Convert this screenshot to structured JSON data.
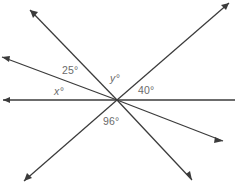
{
  "figure": {
    "type": "geometry-angle-diagram",
    "vertex": {
      "x": 117,
      "y": 100
    },
    "canvas": {
      "width": 235,
      "height": 185
    },
    "stroke_color": "#3b3b3b",
    "label_color": "#6b6b6b",
    "background_color": "#ffffff"
  },
  "labels": {
    "angle_25": "25°",
    "angle_x": "x°",
    "angle_y": "y°",
    "angle_40": "40°",
    "angle_96": "96°"
  },
  "label_positions": {
    "angle_25": {
      "x": 62,
      "y": 65
    },
    "angle_x": {
      "x": 54,
      "y": 86
    },
    "angle_y": {
      "x": 110,
      "y": 73
    },
    "angle_40": {
      "x": 138,
      "y": 85
    },
    "angle_96": {
      "x": 103,
      "y": 116
    }
  },
  "rays": [
    {
      "name": "ray-left-horizontal",
      "endpoint": {
        "x": 3,
        "y": 100
      },
      "arrow": true
    },
    {
      "name": "ray-right-horizontal",
      "endpoint": {
        "x": 235,
        "y": 100
      },
      "arrow": false
    },
    {
      "name": "ray-upper-left-steep",
      "endpoint": {
        "x": 30,
        "y": 10
      },
      "arrow": true
    },
    {
      "name": "ray-upper-left-shallow",
      "endpoint": {
        "x": 2,
        "y": 57
      },
      "arrow": true
    },
    {
      "name": "ray-upper-right",
      "endpoint": {
        "x": 229,
        "y": 3
      },
      "arrow": true
    },
    {
      "name": "ray-lower-right-shallow",
      "endpoint": {
        "x": 223,
        "y": 141
      },
      "arrow": true
    },
    {
      "name": "ray-lower-left",
      "endpoint": {
        "x": 24,
        "y": 181
      },
      "arrow": true
    },
    {
      "name": "ray-lower-right-steep",
      "endpoint": {
        "x": 192,
        "y": 180
      },
      "arrow": true
    }
  ]
}
